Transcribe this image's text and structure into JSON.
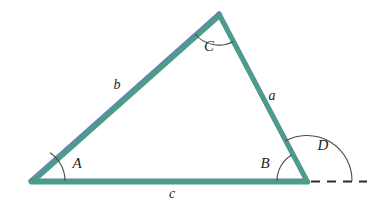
{
  "figure": {
    "type": "triangle-exterior-angle-diagram",
    "background_color": "#ffffff",
    "stroke_color": "#4a9e87",
    "stroke_color_secondary": "#5f7fb0",
    "label_color": "#231f20",
    "arc_color": "#4b4b4b",
    "dash_color": "#2b2b2b"
  },
  "vertices": {
    "A": {
      "label": "A",
      "x": 31,
      "y": 181
    },
    "B": {
      "label": "B",
      "x": 307,
      "y": 181
    },
    "C": {
      "label": "C",
      "x": 219,
      "y": 14
    }
  },
  "sides": {
    "a": {
      "label": "a",
      "from": "B",
      "to": "C",
      "label_x": 272,
      "label_y": 97
    },
    "b": {
      "label": "b",
      "from": "A",
      "to": "C",
      "label_x": 117,
      "label_y": 86
    },
    "c": {
      "label": "c",
      "from": "A",
      "to": "B",
      "label_x": 172,
      "label_y": 194
    }
  },
  "angles": {
    "A": {
      "label": "A",
      "label_x": 77,
      "label_y": 165,
      "arc_radius": 34
    },
    "B": {
      "label": "B",
      "label_x": 265,
      "label_y": 165,
      "arc_radius": 30
    },
    "C": {
      "label": "C",
      "label_x": 209,
      "label_y": 48,
      "arc_radius": 32
    },
    "D": {
      "label": "D",
      "label_x": 323,
      "label_y": 147,
      "arc_radius": 45,
      "is_exterior": true
    }
  },
  "extension_line": {
    "name": "dashed-base-extension",
    "from_x": 311,
    "to_x": 367,
    "y": 181,
    "style": "dashed"
  }
}
